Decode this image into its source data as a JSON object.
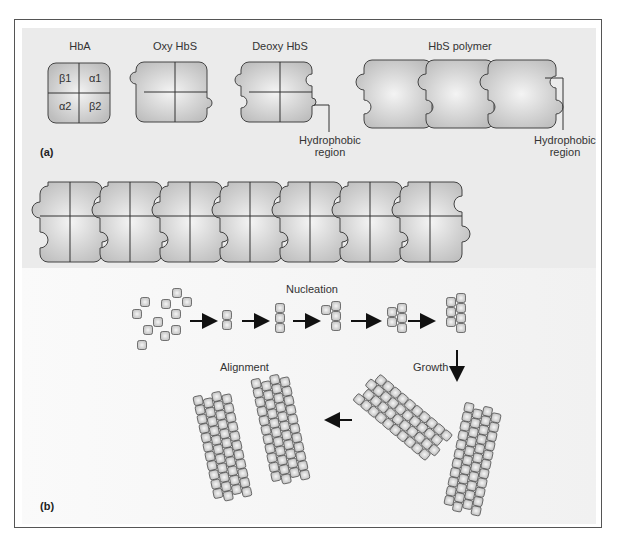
{
  "panel_a": {
    "label": "(a)",
    "titles": {
      "hba": "HbA",
      "oxy": "Oxy HbS",
      "deoxy": "Deoxy HbS",
      "polymer": "HbS polymer"
    },
    "subunits": [
      "β1",
      "α1",
      "α2",
      "β2"
    ],
    "callouts": [
      {
        "line1": "Hydrophobic",
        "line2": "region"
      },
      {
        "line1": "Hydrophobic",
        "line2": "region"
      }
    ],
    "long_chain_units": 7
  },
  "panel_b": {
    "label": "(b)",
    "stages": {
      "nucleation": "Nucleation",
      "growth": "Growth",
      "alignment": "Alignment"
    }
  },
  "colors": {
    "shape_fill": "#c8c8c8",
    "shape_highlight": "#f2f2f2",
    "outline": "#444444",
    "panel_bg": "#ebebeb"
  }
}
